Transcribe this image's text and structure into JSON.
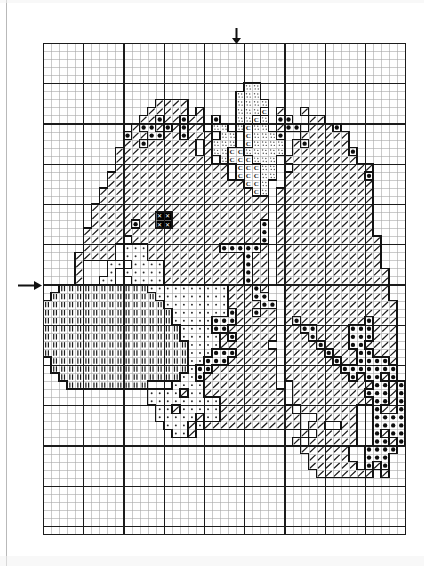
{
  "document": {
    "kind": "cross-stitch-pattern-chart",
    "title": "Cross Stitch Pattern Chart"
  },
  "grid": {
    "origin_x": 43,
    "origin_y": 43,
    "cell_size": 8.05,
    "cols": 45,
    "rows": 61,
    "thin_line_color": "#a8a8a8",
    "bold_line_color": "#1c1c1c",
    "bold_every": 5,
    "border_color": "#1c1c1c",
    "background": "#ffffff"
  },
  "markers": {
    "top_arrow": {
      "label": "center-column-marker",
      "col": 24,
      "y": 28,
      "height": 15
    },
    "left_arrow": {
      "label": "center-row-marker",
      "row": 30,
      "x": 18,
      "width": 22
    }
  },
  "legend": {
    "symbols": [
      {
        "key": "slash",
        "glyph": "/",
        "name": "diagonal-slash-stitch",
        "color": "#1b1b1b"
      },
      {
        "key": "dot",
        "glyph": "●",
        "name": "filled-dot-stitch",
        "color": "#0d0d0d"
      },
      {
        "key": "cee",
        "glyph": "C",
        "name": "letter-c-stitch",
        "color": "#1b1b1b"
      },
      {
        "key": "stipple",
        "glyph": "··",
        "name": "stipple-stitch",
        "color": "#555555"
      },
      {
        "key": "smalldot",
        "glyph": "·",
        "name": "small-dot-stitch",
        "color": "#2a2a2a"
      },
      {
        "key": "bars",
        "glyph": "II",
        "name": "double-bar-stitch",
        "color": "#1b1b1b"
      },
      {
        "key": "solid",
        "glyph": "✕",
        "name": "solid-black-stitch",
        "color": "#000000"
      },
      {
        "key": "blank",
        "glyph": "",
        "name": "empty-cell",
        "color": "#ffffff"
      }
    ]
  },
  "chart_data": {
    "type": "heatmap",
    "xlabel": "",
    "ylabel": "",
    "cols": 45,
    "rows": 61,
    "legend_position": "none",
    "symbol_keys": [
      "blank",
      "slash",
      "dot",
      "cee",
      "stipple",
      "smalldot",
      "bars",
      "solid"
    ],
    "rows_data": [
      "---------------------------------------------",
      "---------------------------------------------",
      "---------------------------------------------",
      "---------------------------------------------",
      "---------------------------------------------",
      "-------------------------ss------------------",
      "------------------------sss------------------",
      "--------------////------ssss-----------------",
      "-------------/////-/----sssC-/--/------------",
      "------------//o//o//-o--ssCs-oo--//----------",
      "-----------/oo/o/o//-ss-sCss-/oo-///o--------",
      "----------o//oo//o///-ss-Cssso--//////-------",
      "----------//o//////-/sss-Cssss-/o/////-------",
      "---------//////////-/ssCCsssss-///////o------",
      "---------////////////-sCCCsss-/////////------",
      "---------//////////////-CCCss--//////////----",
      "--------///////////////-CCCss-//////////o----",
      "--------/////////////////CCs--///////////----",
      "-------///////////////////Cs-////////////----",
      "-------/////////////////////-////////////----",
      "------//////////////////////-////////////----",
      "------////////XX////////////-////////////----",
      "------/////o//XX///////////o-////////////----",
      "-----//////////////////////o-////////////----",
      "-----/////-////////////////o-/////////////---",
      "-----////-.../////////ooooo/-/////////////---",
      "----/////-...////////////o//-/////////////---",
      "----/---..-....//////////o//-/////////////---",
      "----/---.-.....//////////o//-//////////////--",
      "----/--..--....//////////o//-//////////////--",
      "--bbbbbbbbbbb..........///o/--/////////////--",
      "-bbbbbbbbbbbbb.........///oo--/////////////--",
      "bbbbbbbbbbbbbbb........////oo-//////////////-",
      "bbbbbbbbbbbbbbbb.......o//o//-//////////////-",
      "bbbbbbbbbbbbbbbb.....ooo/////-/o////////o///-",
      "bbbbbbbbbbbbbbbbb....oo//////-//oo////ooo///-",
      "bbbbbbbbbbbbbbbbb...../o/////-///o////ooo///-",
      "bbbbbbbbbbbbbbbbbb....//////--////o///oo////-",
      "bbbbbbbbbbbbbbbbbb...ooo/////-/////o///oo///-",
      "-bbbbbbbbbbbbbbbbb..ooo//////-//////o//oooo/-",
      "-bbbbbbbbbbbbbbbbb.oo////////-///////ooooooo-",
      "--bbbbbbbbbbbbbbb..o/////////-////////o/oo/o-",
      "---bbbbbbbbbb---..../////////--//////////oo/o",
      "-------------..../..//////////-/////////ooo/o",
      "-------------.........////////-//////////oo/o",
      "--------------../...../////////-///////--o//o",
      "--------------...../..//////////--/////--oooo",
      "---------------..././///////////-//--//--oooo",
      "----------------../-------------/-/////--o/oo",
      "-------------------------------/-//////--oo/o",
      "--------------------------------//////--oooo-",
      "---------------------------------/////--ooo--",
      "---------------------------------//////-o/o--",
      "----------------------------------///////-/--",
      "---------------------------------------------",
      "---------------------------------------------",
      "---------------------------------------------",
      "---------------------------------------------",
      "---------------------------------------------",
      "---------------------------------------------",
      "---------------------------------------------"
    ],
    "key_map": {
      "-": "blank",
      "/": "slash",
      "o": "dot",
      "C": "cee",
      "s": "stipple",
      ".": "smalldot",
      "b": "bars",
      "X": "solid"
    },
    "regions": [
      {
        "name": "hedgehog-body-upper",
        "symbol": "slash"
      },
      {
        "name": "hedgehog-face-highlight",
        "symbol": "stipple"
      },
      {
        "name": "hedgehog-face-shadow",
        "symbol": "cee"
      },
      {
        "name": "hedgehog-eye",
        "symbol": "solid"
      },
      {
        "name": "ground-texture-left",
        "symbol": "bars"
      },
      {
        "name": "ground-texture-mid",
        "symbol": "smalldot"
      },
      {
        "name": "quill-shading",
        "symbol": "dot"
      }
    ]
  }
}
